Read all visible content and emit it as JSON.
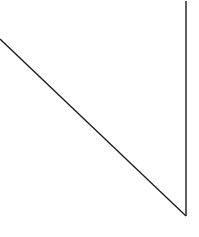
{
  "diagram": {
    "shape": "right-triangle",
    "stroke_color": "#1a1a1a",
    "fill_color": "#ffffff",
    "background_color": "#ffffff",
    "edges": [
      {
        "name": "top-edge",
        "orientation": "horizontal"
      },
      {
        "name": "right-edge",
        "orientation": "vertical"
      },
      {
        "name": "hypotenuse",
        "orientation": "diagonal"
      }
    ]
  }
}
